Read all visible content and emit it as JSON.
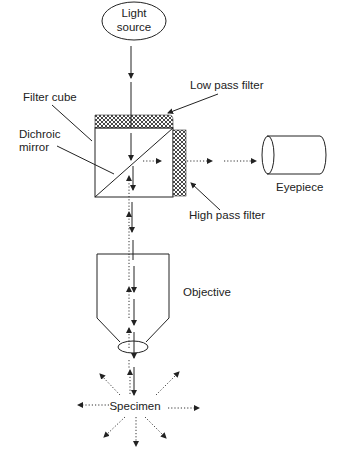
{
  "diagram": {
    "labels": {
      "light_source_line1": "Light",
      "light_source_line2": "source",
      "low_pass_filter": "Low pass filter",
      "filter_cube": "Filter cube",
      "dichroic_mirror_line1": "Dichroic",
      "dichroic_mirror_line2": "mirror",
      "high_pass_filter": "High pass filter",
      "eyepiece": "Eyepiece",
      "objective": "Objective",
      "specimen": "Specimen"
    },
    "components": [
      "light-source",
      "low-pass-filter",
      "filter-cube",
      "dichroic-mirror",
      "high-pass-filter",
      "eyepiece",
      "objective",
      "objective-lens",
      "specimen"
    ],
    "colors": {
      "line": "#222222",
      "background": "#ffffff"
    }
  }
}
